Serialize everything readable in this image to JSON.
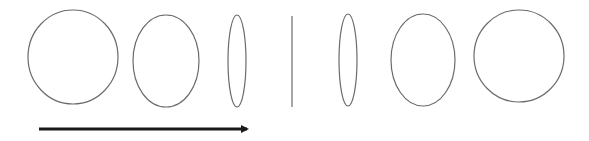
{
  "diagram": {
    "stroke_color": "#6b6b6b",
    "arrow_color": "#1a1a1a",
    "shapes": [
      {
        "type": "ellipse",
        "cx": 73,
        "cy": 57,
        "rx": 45,
        "ry": 47
      },
      {
        "type": "ellipse",
        "cx": 166,
        "cy": 61,
        "rx": 33,
        "ry": 46
      },
      {
        "type": "ellipse",
        "cx": 237,
        "cy": 61,
        "rx": 9,
        "ry": 46
      },
      {
        "type": "line",
        "x1": 292,
        "y1": 16,
        "x2": 292,
        "y2": 107
      },
      {
        "type": "ellipse",
        "cx": 348,
        "cy": 60,
        "rx": 9,
        "ry": 46
      },
      {
        "type": "ellipse",
        "cx": 423,
        "cy": 60,
        "rx": 32,
        "ry": 46
      },
      {
        "type": "ellipse",
        "cx": 519,
        "cy": 56,
        "rx": 45,
        "ry": 46
      }
    ],
    "arrow": {
      "x1": 39,
      "y1": 129,
      "x2": 253,
      "y2": 129,
      "direction": "right"
    }
  }
}
